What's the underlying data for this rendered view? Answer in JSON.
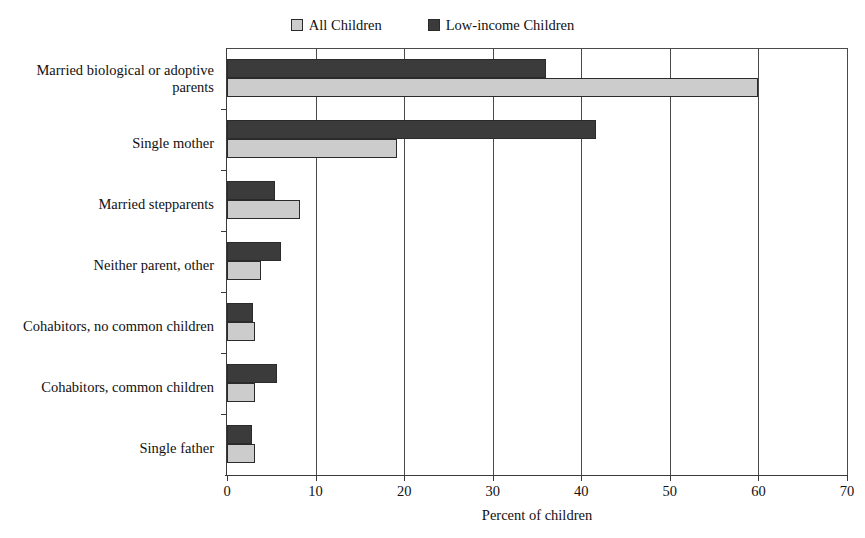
{
  "legend": {
    "position": "top-center",
    "entries": [
      {
        "label": "All Children",
        "series_key": "all_children",
        "color": "#cccccc"
      },
      {
        "label": "Low-income Children",
        "series_key": "low_income_children",
        "color": "#3b3b3b"
      }
    ]
  },
  "axis": {
    "xlabel": "Percent of children",
    "xticks": [
      "0",
      "10",
      "20",
      "30",
      "40",
      "50",
      "60",
      "70"
    ]
  },
  "chart_data": {
    "type": "bar",
    "orientation": "horizontal",
    "title": "",
    "subtitle": "",
    "xlabel": "Percent of children",
    "ylabel": "",
    "xlim": [
      0,
      70
    ],
    "xticks": [
      0,
      10,
      20,
      30,
      40,
      50,
      60,
      70
    ],
    "grid": "vertical-gridlines-at-xticks",
    "legend": "top-center",
    "categories": [
      "Married biological or adoptive parents",
      "Single mother",
      "Married stepparents",
      "Neither parent, other",
      "Cohabitors, no common children",
      "Cohabitors, common children",
      "Single father"
    ],
    "category_lines": [
      [
        "Married biological or adoptive",
        "parents"
      ],
      [
        "Single mother"
      ],
      [
        "Married stepparents"
      ],
      [
        "Neither parent, other"
      ],
      [
        "Cohabitors, no common children"
      ],
      [
        "Cohabitors, common children"
      ],
      [
        "Single father"
      ]
    ],
    "series": [
      {
        "name": "Low-income Children",
        "color": "#3b3b3b",
        "values": [
          36.0,
          41.7,
          5.4,
          6.1,
          2.9,
          5.6,
          2.8
        ]
      },
      {
        "name": "All Children",
        "color": "#cccccc",
        "values": [
          60.0,
          19.2,
          8.2,
          3.8,
          3.2,
          3.2,
          3.2
        ]
      }
    ]
  }
}
